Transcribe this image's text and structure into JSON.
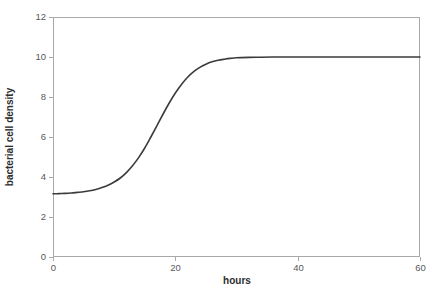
{
  "figure": {
    "background_color": "#ffffff",
    "width": 440,
    "height": 301
  },
  "chart_data": {
    "type": "line",
    "title": "",
    "subtitle": "",
    "xlabel": "hours",
    "ylabel": "bacterial cell density",
    "xlim": [
      0,
      60
    ],
    "ylim": [
      0,
      12
    ],
    "xticks": [
      0,
      20,
      40,
      60
    ],
    "yticks": [
      0,
      2,
      4,
      6,
      8,
      10,
      12
    ],
    "xtick_labels": [
      "0",
      "20",
      "40",
      "60"
    ],
    "ytick_labels": [
      "0",
      "2",
      "4",
      "6",
      "8",
      "10",
      "12"
    ],
    "grid": false,
    "legend": null,
    "legend_position": "none",
    "frame": "full-rectangle",
    "annotations": [],
    "series": [
      {
        "name": "bacterial growth",
        "color": "#3b3b3d",
        "line_width": 1.6,
        "description": "sigmoidal (logistic) growth curve: lag phase at 3.15, exponential phase, plateau at 10.0",
        "model": "logistic",
        "baseline": 3.15,
        "plateau": 10.0,
        "midpoint_hours": 16.0,
        "growth_rate": 0.28,
        "x": [
          0,
          1,
          2,
          3,
          4,
          5,
          6,
          7,
          8,
          9,
          10,
          11,
          12,
          13,
          14,
          15,
          16,
          17,
          18,
          19,
          20,
          21,
          22,
          23,
          24,
          25,
          26,
          27,
          28,
          29,
          30,
          32,
          34,
          36,
          38,
          40,
          44,
          48,
          52,
          56,
          60
        ],
        "values": [
          3.16,
          3.17,
          3.18,
          3.2,
          3.23,
          3.26,
          3.31,
          3.38,
          3.47,
          3.59,
          3.75,
          3.95,
          4.22,
          4.56,
          4.97,
          5.45,
          6.0,
          6.57,
          7.15,
          7.7,
          8.2,
          8.63,
          8.99,
          9.27,
          9.48,
          9.64,
          9.76,
          9.84,
          9.89,
          9.93,
          9.96,
          9.98,
          9.99,
          10.0,
          10.0,
          10.0,
          10.0,
          10.0,
          10.0,
          10.0,
          10.0
        ]
      }
    ]
  },
  "axes_geometry": {
    "plot_left_px": 53,
    "plot_right_px": 420,
    "plot_top_px": 17,
    "plot_bottom_px": 257
  }
}
